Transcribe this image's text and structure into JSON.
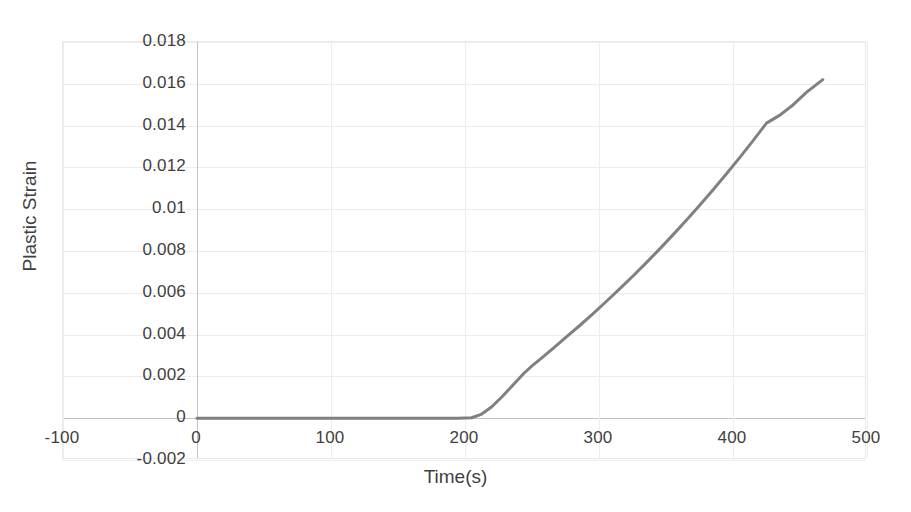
{
  "chart_data": {
    "type": "line",
    "title": "",
    "xlabel": "Time(s)",
    "ylabel": "Plastic Strain",
    "xlim": [
      -100,
      500
    ],
    "ylim": [
      -0.002,
      0.018
    ],
    "grid": true,
    "legend": false,
    "legend_position": "none",
    "line_color": "#808080",
    "line_width": 3,
    "xticks": [
      "-100",
      "0",
      "100",
      "200",
      "300",
      "400",
      "500"
    ],
    "xtick_values": [
      -100,
      0,
      100,
      200,
      300,
      400,
      500
    ],
    "yticks": [
      "-0.002",
      "0",
      "0.002",
      "0.004",
      "0.006",
      "0.008",
      "0.01",
      "0.012",
      "0.014",
      "0.016",
      "0.018"
    ],
    "ytick_values": [
      -0.002,
      0,
      0.002,
      0.004,
      0.006,
      0.008,
      0.01,
      0.012,
      0.014,
      0.016,
      0.018
    ],
    "series": [
      {
        "name": "Plastic Strain",
        "color": "#808080",
        "x": [
          0,
          20,
          40,
          60,
          80,
          100,
          120,
          140,
          160,
          180,
          195,
          205,
          212,
          220,
          228,
          236,
          244,
          250,
          258,
          266,
          275,
          285,
          295,
          305,
          315,
          325,
          335,
          345,
          355,
          365,
          375,
          385,
          395,
          405,
          415,
          425,
          435,
          445,
          455,
          467
        ],
        "y": [
          0,
          0,
          0,
          0,
          0,
          0,
          0,
          0,
          0,
          0,
          0,
          2e-05,
          0.00018,
          0.00055,
          0.00105,
          0.0016,
          0.00215,
          0.0025,
          0.00292,
          0.00335,
          0.00385,
          0.0044,
          0.00497,
          0.00556,
          0.00616,
          0.00678,
          0.00742,
          0.00808,
          0.00876,
          0.00946,
          0.01018,
          0.01092,
          0.01168,
          0.01247,
          0.01328,
          0.01412,
          0.0145,
          0.015,
          0.0156,
          0.0162
        ]
      }
    ],
    "annotations": [
      {
        "label": "onset of plastic strain",
        "x": 205,
        "y": 0
      },
      {
        "label": "slope change knee",
        "x": 250,
        "y": 0.0025
      },
      {
        "label": "final point",
        "x": 467,
        "y": 0.0162
      }
    ]
  }
}
